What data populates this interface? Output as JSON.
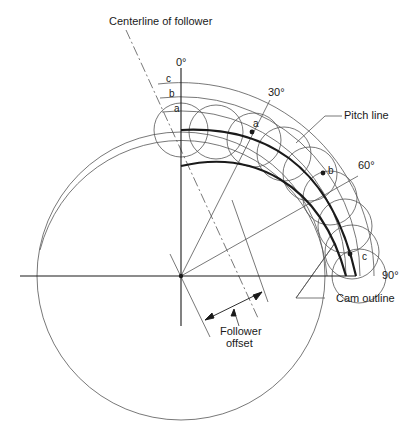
{
  "figure": {
    "type": "cam layout diagram",
    "labels": {
      "centerline_of_follower": "Centerline of follower",
      "pitch_line": "Pitch line",
      "cam_outline": "Cam outline",
      "follower_offset_line1": "Follower",
      "follower_offset_line2": "offset"
    },
    "angles": {
      "a0": "0°",
      "a30": "30°",
      "a60": "60°",
      "a90": "90°"
    },
    "points": {
      "c": "c",
      "b": "b",
      "a": "a"
    },
    "colors": {
      "line": "#1a1a1a",
      "thin": "#555555",
      "background": "#ffffff"
    }
  }
}
